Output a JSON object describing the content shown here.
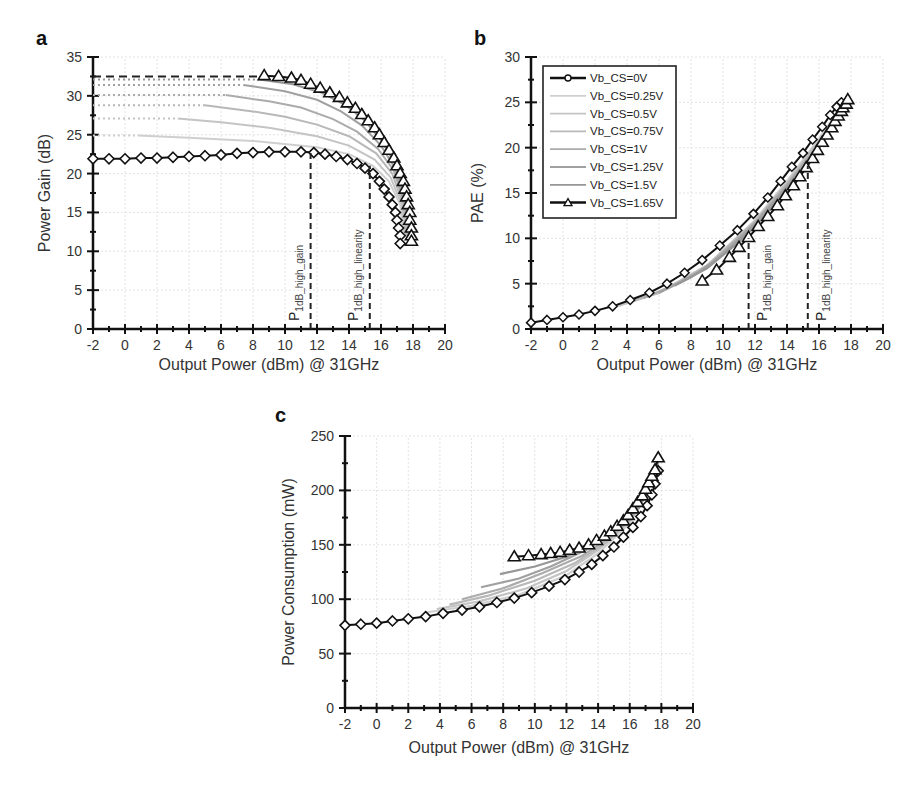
{
  "panels": {
    "a": {
      "label": "a"
    },
    "b": {
      "label": "b"
    },
    "c": {
      "label": "c"
    }
  },
  "chart_data": [
    {
      "id": "a",
      "type": "line",
      "title": "",
      "panel_label": "a",
      "xlabel": "Output Power (dBm) @ 31GHz",
      "ylabel": "Power Gain (dB)",
      "xlim": [
        -2,
        20
      ],
      "ylim": [
        0,
        35
      ],
      "xticks": [
        -2,
        0,
        2,
        4,
        6,
        8,
        10,
        12,
        14,
        16,
        18,
        20
      ],
      "yticks": [
        0,
        5,
        10,
        15,
        20,
        25,
        30,
        35
      ],
      "grid": true,
      "annotations": [
        {
          "text": "P",
          "sub": "1dB_high_gain",
          "x": 11.6
        },
        {
          "text": "P",
          "sub": "1dB_high_linearity",
          "x": 15.3
        }
      ],
      "reference_line": {
        "style": "dashed",
        "y": 32.5,
        "x": [
          -2,
          8.6
        ]
      },
      "series": [
        {
          "name": "Vb_CS=0V",
          "marker": "diamond",
          "x": [
            -2,
            -1,
            0,
            1,
            2,
            3,
            4,
            5,
            6,
            7,
            8,
            9,
            10,
            11,
            11.8,
            12.5,
            13.2,
            13.9,
            14.5,
            15.0,
            15.5,
            15.9,
            16.2,
            16.5,
            16.7,
            16.9,
            17.0,
            17.1,
            17.2,
            17.2
          ],
          "y": [
            21.9,
            21.9,
            21.9,
            22.0,
            22.0,
            22.1,
            22.2,
            22.3,
            22.4,
            22.6,
            22.7,
            22.8,
            22.8,
            22.8,
            22.7,
            22.5,
            22.2,
            21.8,
            21.3,
            20.7,
            20.0,
            19.0,
            18.0,
            17.0,
            16.0,
            15.0,
            14.0,
            13.0,
            12.0,
            11.0
          ]
        },
        {
          "name": "Vb_CS=0.25V",
          "x": [
            -2,
            0.8,
            4,
            8,
            12,
            14,
            15.5,
            16.5,
            17.2,
            17.4
          ],
          "y": [
            24.9,
            24.9,
            24.6,
            24.2,
            23.4,
            22.5,
            21.0,
            19.0,
            16.0,
            12.0
          ]
        },
        {
          "name": "Vb_CS=0.5V",
          "x": [
            -2,
            3.3,
            6,
            9,
            12,
            14,
            15.6,
            16.6,
            17.3,
            17.5
          ],
          "y": [
            27.1,
            27.1,
            26.6,
            25.9,
            24.8,
            23.6,
            21.8,
            19.5,
            16.0,
            12.0
          ]
        },
        {
          "name": "Vb_CS=0.75V",
          "x": [
            -2,
            5.0,
            8,
            10,
            12,
            14,
            15.7,
            16.7,
            17.4,
            17.6
          ],
          "y": [
            28.8,
            28.8,
            28.0,
            27.3,
            26.3,
            24.8,
            22.6,
            20.0,
            16.0,
            12.0
          ]
        },
        {
          "name": "Vb_CS=1V",
          "x": [
            -2,
            6.3,
            9,
            11,
            13,
            14.5,
            15.8,
            16.8,
            17.5,
            17.7
          ],
          "y": [
            30.1,
            30.1,
            29.3,
            28.5,
            27.0,
            25.4,
            23.2,
            20.4,
            16.0,
            12.0
          ]
        },
        {
          "name": "Vb_CS=1.25V",
          "x": [
            -2,
            7.4,
            10,
            12,
            13.5,
            14.8,
            16.0,
            16.9,
            17.5,
            17.8
          ],
          "y": [
            31.4,
            31.4,
            30.6,
            29.5,
            28.0,
            26.2,
            23.6,
            20.6,
            16.0,
            12.0
          ]
        },
        {
          "name": "Vb_CS=1.5V",
          "x": [
            -2,
            8.4,
            10.5,
            12.3,
            13.8,
            15.0,
            16.1,
            17.0,
            17.6,
            17.9
          ],
          "y": [
            32.1,
            32.1,
            31.5,
            30.4,
            28.8,
            26.8,
            24.0,
            20.8,
            16.0,
            12.0
          ]
        },
        {
          "name": "Vb_CS=1.65V",
          "marker": "triangle",
          "x": [
            8.7,
            9.6,
            10.4,
            11.0,
            11.6,
            12.2,
            12.8,
            13.4,
            13.9,
            14.4,
            14.8,
            15.2,
            15.6,
            15.9,
            16.2,
            16.5,
            16.8,
            17.0,
            17.2,
            17.4,
            17.5,
            17.6,
            17.7,
            17.8,
            17.8,
            17.9,
            17.9,
            17.9
          ],
          "y": [
            32.6,
            32.5,
            32.3,
            32.0,
            31.5,
            31.0,
            30.4,
            29.8,
            29.1,
            28.4,
            27.6,
            26.8,
            25.9,
            25.0,
            24.0,
            23.0,
            22.0,
            21.0,
            20.0,
            19.0,
            18.0,
            17.0,
            16.0,
            15.0,
            14.0,
            13.0,
            12.0,
            11.3
          ]
        }
      ]
    },
    {
      "id": "b",
      "type": "line",
      "title": "",
      "panel_label": "b",
      "xlabel": "Output Power (dBm) @ 31GHz",
      "ylabel": "PAE (%)",
      "xlim": [
        -2,
        20
      ],
      "ylim": [
        0,
        30
      ],
      "xticks": [
        -2,
        0,
        2,
        4,
        6,
        8,
        10,
        12,
        14,
        16,
        18,
        20
      ],
      "yticks": [
        0,
        5,
        10,
        15,
        20,
        25,
        30
      ],
      "grid": true,
      "legend": {
        "position": "upper-left",
        "entries": [
          "Vb_CS=0V",
          "Vb_CS=0.25V",
          "Vb_CS=0.5V",
          "Vb_CS=0.75V",
          "Vb_CS=1V",
          "Vb_CS=1.25V",
          "Vb_CS=1.5V",
          "Vb_CS=1.65V"
        ]
      },
      "annotations": [
        {
          "text": "P",
          "sub": "1dB_high_gain",
          "x": 11.6
        },
        {
          "text": "P",
          "sub": "1dB_high_linearity",
          "x": 15.3
        }
      ],
      "series": [
        {
          "name": "Vb_CS=0V",
          "marker": "circle",
          "x": [
            -2,
            -1,
            0,
            1,
            2,
            3.1,
            4.2,
            5.4,
            6.5,
            7.6,
            8.7,
            9.8,
            10.9,
            11.9,
            12.8,
            13.6,
            14.3,
            15.0,
            15.6,
            16.2,
            16.7,
            17.1,
            17.4
          ],
          "y": [
            0.7,
            1.0,
            1.3,
            1.6,
            2.0,
            2.5,
            3.2,
            4.0,
            5.0,
            6.2,
            7.6,
            9.2,
            10.9,
            12.7,
            14.5,
            16.3,
            17.9,
            19.4,
            20.9,
            22.3,
            23.6,
            24.5,
            25.0
          ]
        },
        {
          "name": "Vb_CS=0.25V",
          "x": [
            3,
            6,
            9,
            12,
            14,
            16,
            17.5
          ],
          "y": [
            2.3,
            4.0,
            7.0,
            12.0,
            16.3,
            21.0,
            24.8
          ]
        },
        {
          "name": "Vb_CS=0.5V",
          "x": [
            3.5,
            6,
            9,
            12,
            14,
            16,
            17.6
          ],
          "y": [
            2.6,
            4.0,
            7.0,
            11.9,
            16.1,
            20.8,
            24.9
          ]
        },
        {
          "name": "Vb_CS=0.75V",
          "x": [
            4,
            6,
            9,
            12,
            14,
            16,
            17.6
          ],
          "y": [
            2.9,
            4.0,
            6.9,
            11.8,
            16.0,
            20.6,
            25.0
          ]
        },
        {
          "name": "Vb_CS=1V",
          "x": [
            5,
            7,
            9,
            12,
            14,
            16,
            17.7
          ],
          "y": [
            3.4,
            4.9,
            6.8,
            11.7,
            15.9,
            20.4,
            25.1
          ]
        },
        {
          "name": "Vb_CS=1.25V",
          "x": [
            6,
            8,
            10,
            12,
            14,
            16,
            17.7
          ],
          "y": [
            4.0,
            5.7,
            8.2,
            11.6,
            15.7,
            20.2,
            25.2
          ]
        },
        {
          "name": "Vb_CS=1.5V",
          "x": [
            7,
            9,
            11,
            12.5,
            14,
            16,
            17.7
          ],
          "y": [
            4.8,
            6.7,
            9.6,
            12.3,
            15.5,
            20.0,
            25.3
          ]
        },
        {
          "name": "Vb_CS=1.65V",
          "marker": "triangle",
          "x": [
            8.7,
            9.6,
            10.4,
            11.0,
            11.6,
            12.2,
            12.8,
            13.4,
            13.9,
            14.4,
            14.8,
            15.2,
            15.6,
            15.9,
            16.2,
            16.5,
            16.8,
            17.0,
            17.2,
            17.4,
            17.5,
            17.7,
            17.8
          ],
          "y": [
            5.3,
            6.5,
            7.9,
            9.0,
            10.1,
            11.3,
            12.4,
            13.6,
            14.7,
            15.8,
            16.8,
            17.8,
            18.8,
            19.7,
            20.6,
            21.4,
            22.2,
            22.9,
            23.5,
            24.0,
            24.4,
            24.8,
            25.3
          ]
        }
      ]
    },
    {
      "id": "c",
      "type": "line",
      "title": "",
      "panel_label": "c",
      "xlabel": "Output Power (dBm) @ 31GHz",
      "ylabel": "Power Consumption (mW)",
      "xlim": [
        -2,
        20
      ],
      "ylim": [
        0,
        250
      ],
      "xticks": [
        -2,
        0,
        2,
        4,
        6,
        8,
        10,
        12,
        14,
        16,
        18,
        20
      ],
      "yticks": [
        0,
        50,
        100,
        150,
        200,
        250
      ],
      "grid": true,
      "series": [
        {
          "name": "Vb_CS=0V",
          "marker": "diamond",
          "x": [
            -2,
            -1,
            0,
            1,
            2,
            3.1,
            4.2,
            5.4,
            6.5,
            7.6,
            8.7,
            9.8,
            10.9,
            11.9,
            12.8,
            13.6,
            14.3,
            15.0,
            15.6,
            16.2,
            16.7,
            17.1,
            17.4,
            17.6,
            17.8
          ],
          "y": [
            76,
            77,
            78,
            80,
            82,
            84,
            87,
            90,
            93,
            97,
            101,
            106,
            112,
            118,
            125,
            132,
            140,
            148,
            157,
            166,
            176,
            186,
            196,
            206,
            218
          ]
        },
        {
          "name": "Vb_CS=0.25V",
          "x": [
            3.2,
            6,
            9,
            12,
            14,
            16,
            17.8
          ],
          "y": [
            88,
            94,
            104,
            122,
            142,
            170,
            222
          ]
        },
        {
          "name": "Vb_CS=0.5V",
          "x": [
            3.8,
            6.5,
            9.5,
            12,
            14,
            16,
            17.8
          ],
          "y": [
            91,
            98,
            110,
            126,
            145,
            172,
            223
          ]
        },
        {
          "name": "Vb_CS=0.75V",
          "x": [
            4.6,
            7,
            10,
            12.5,
            14.5,
            16.2,
            17.8
          ],
          "y": [
            95,
            103,
            117,
            133,
            152,
            176,
            224
          ]
        },
        {
          "name": "Vb_CS=1V",
          "x": [
            5.4,
            8,
            10.5,
            13,
            15,
            16.4,
            17.8
          ],
          "y": [
            100,
            110,
            124,
            140,
            159,
            180,
            225
          ]
        },
        {
          "name": "Vb_CS=1.25V",
          "x": [
            6.6,
            9,
            11,
            13.2,
            15.2,
            16.6,
            17.8
          ],
          "y": [
            111,
            119,
            130,
            145,
            164,
            184,
            226
          ]
        },
        {
          "name": "Vb_CS=1.5V",
          "x": [
            7.8,
            10,
            12,
            13.8,
            15.4,
            16.8,
            17.8
          ],
          "y": [
            123,
            130,
            139,
            152,
            169,
            190,
            227
          ]
        },
        {
          "name": "Vb_CS=1.65V",
          "marker": "triangle",
          "x": [
            8.7,
            9.6,
            10.4,
            11.0,
            11.6,
            12.2,
            12.8,
            13.4,
            13.9,
            14.4,
            14.8,
            15.2,
            15.6,
            15.9,
            16.2,
            16.5,
            16.8,
            17.0,
            17.2,
            17.4,
            17.6,
            17.8
          ],
          "y": [
            139,
            140,
            141,
            142,
            143,
            145,
            147,
            150,
            154,
            158,
            162,
            167,
            172,
            177,
            183,
            189,
            195,
            201,
            207,
            213,
            219,
            230
          ]
        }
      ]
    }
  ]
}
